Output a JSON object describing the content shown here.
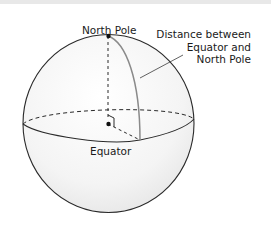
{
  "diagram": {
    "labels": {
      "north_pole": "North Pole",
      "equator": "Equator",
      "distance": [
        "Distance between",
        "Equator and",
        "North Pole"
      ]
    },
    "colors": {
      "outline": "#2a2a2a",
      "shade": "#ececec",
      "meridian": "#8a8a8a"
    }
  }
}
